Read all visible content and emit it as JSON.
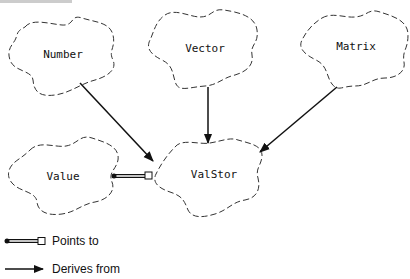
{
  "diagram": {
    "nodes": [
      {
        "id": "number",
        "label": "Number"
      },
      {
        "id": "vector",
        "label": "Vector"
      },
      {
        "id": "matrix",
        "label": "Matrix"
      },
      {
        "id": "value",
        "label": "Value"
      },
      {
        "id": "valstor",
        "label": "ValStor"
      }
    ],
    "edges": [
      {
        "from": "Number",
        "to": "ValStor",
        "type": "derives-from"
      },
      {
        "from": "Vector",
        "to": "ValStor",
        "type": "derives-from"
      },
      {
        "from": "Matrix",
        "to": "ValStor",
        "type": "derives-from"
      },
      {
        "from": "Value",
        "to": "ValStor",
        "type": "points-to"
      }
    ]
  },
  "legend": {
    "points_to": "Points to",
    "derives_from": "Derives from"
  },
  "colors": {
    "stroke": "#333333",
    "text": "#111111",
    "background": "#ffffff"
  }
}
